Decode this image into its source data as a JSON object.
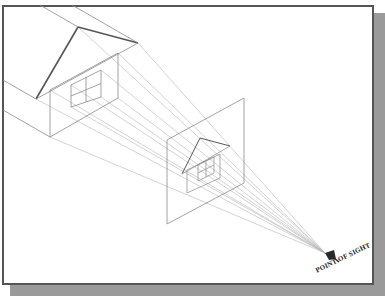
{
  "figure": {
    "label": "POINT OF SIGHT",
    "colors": {
      "line": "#8a8a8a",
      "heavy": "#555555",
      "ray": "#b5b5b5",
      "eye": "#2a2a2a"
    },
    "point_of_sight": [
      325,
      253
    ],
    "big_house": {
      "roof_apex": [
        78,
        27
      ],
      "roof_right": [
        138,
        43
      ],
      "roof_left": [
        36,
        99
      ],
      "wall": [
        [
          50,
          90
        ],
        [
          118,
          53
        ],
        [
          118,
          98
        ],
        [
          50,
          137
        ]
      ],
      "window": [
        [
          71,
          85
        ],
        [
          101,
          70
        ],
        [
          101,
          97
        ],
        [
          71,
          107
        ]
      ],
      "back_lines": [
        [
          [
            40,
            5
          ],
          [
            78,
            27
          ]
        ],
        [
          [
            72,
            5
          ],
          [
            138,
            43
          ]
        ],
        [
          [
            3,
            80
          ],
          [
            36,
            99
          ]
        ],
        [
          [
            3,
            110
          ],
          [
            50,
            137
          ]
        ]
      ]
    },
    "picture_plane": [
      [
        167,
        140
      ],
      [
        244,
        98
      ],
      [
        244,
        183
      ],
      [
        167,
        224
      ]
    ],
    "small_house": {
      "roof_apex": [
        200,
        138
      ],
      "roof_right": [
        230,
        146
      ],
      "roof_left": [
        182,
        174
      ],
      "wall": [
        [
          187,
          170
        ],
        [
          220,
          154
        ],
        [
          220,
          178
        ],
        [
          187,
          193
        ]
      ],
      "window": [
        [
          198,
          165
        ],
        [
          214,
          157
        ],
        [
          214,
          173
        ],
        [
          198,
          181
        ]
      ]
    }
  }
}
